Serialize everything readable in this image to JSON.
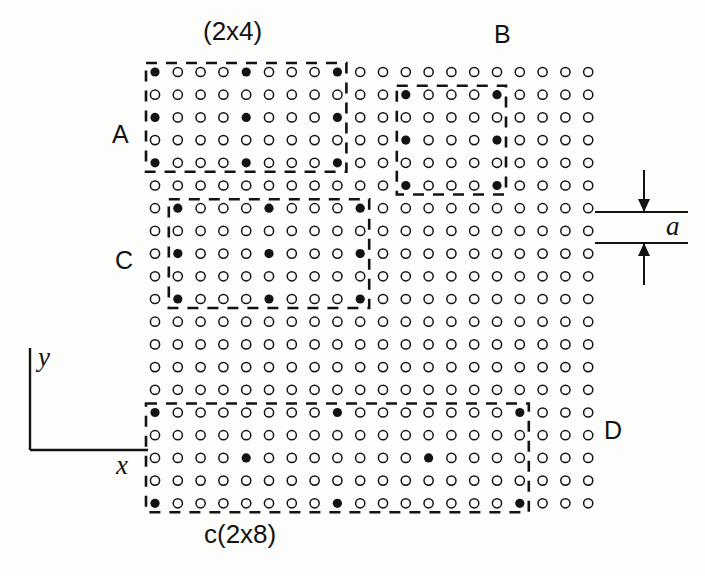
{
  "figure": {
    "title_top": "(2x4)",
    "caption_bottom": "c(2x8)",
    "lattice_label": "a",
    "axis_x": "x",
    "axis_y": "y",
    "background_color": "#fdfdfb",
    "ink_color": "#131313"
  },
  "regions": [
    {
      "id": "A",
      "label": "A",
      "label_x": 112,
      "label_y": 122,
      "structure": "(2x4)",
      "col0": 0,
      "row0": 0,
      "cols": 9,
      "rows": 5,
      "period_x": 4,
      "period_y": 2,
      "centered": false
    },
    {
      "id": "B",
      "label": "B",
      "label_x": 494,
      "label_y": 22,
      "structure": "(4x4)",
      "col0": 11,
      "row0": 1,
      "cols": 5,
      "rows": 5,
      "period_x": 4,
      "period_y": 2,
      "centered": false
    },
    {
      "id": "C",
      "label": "C",
      "label_x": 115,
      "label_y": 248,
      "structure": "(2x4)",
      "col0": 1,
      "row0": 6,
      "cols": 9,
      "rows": 5,
      "period_x": 4,
      "period_y": 2,
      "centered": false
    },
    {
      "id": "D",
      "label": "D",
      "label_x": 604,
      "label_y": 418,
      "structure": "c(2x8)",
      "col0": 0,
      "row0": 15,
      "cols": 17,
      "rows": 5,
      "period_x": 8,
      "period_y": 2,
      "centered": true
    }
  ],
  "grid": {
    "columns": 20,
    "rows": 20,
    "spacing_x": 22.8,
    "spacing_y": 22.7,
    "origin_x": 155,
    "origin_y": 72,
    "open_circle_radius": 4.6,
    "filled_circle_radius": 4.6,
    "substrate_atom_name": "open-circle",
    "adsorbate_atom_name": "filled-circle"
  },
  "annotation_a": {
    "label": "a",
    "line_left": 595,
    "line_right": 688,
    "line_top_y": 212,
    "line_bottom_y": 243,
    "label_x": 666,
    "label_y": 213
  },
  "axes": {
    "corner_x": 30,
    "corner_y": 450,
    "y_top": 348,
    "x_right": 148,
    "x_label_x": 116,
    "x_label_y": 452,
    "y_label_x": 38,
    "y_label_y": 344
  }
}
